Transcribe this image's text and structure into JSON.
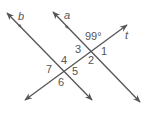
{
  "diagram": {
    "lines": [
      {
        "name": "b",
        "label": "b",
        "from": [
          7,
          13
        ],
        "to": [
          92,
          100
        ]
      },
      {
        "name": "a",
        "label": "a",
        "from": [
          53,
          12
        ],
        "to": [
          140,
          102
        ]
      },
      {
        "name": "t",
        "label": "t",
        "from": [
          25,
          100
        ],
        "to": [
          127,
          25
        ]
      }
    ],
    "given_angle": {
      "label": "99°",
      "value": 99
    },
    "angle_labels": [
      "1",
      "2",
      "3",
      "4",
      "5",
      "6",
      "7"
    ],
    "line_labels": {
      "a": "a",
      "b": "b",
      "t": "t"
    },
    "colors": {
      "stroke": "#555555",
      "text": "#555555",
      "background": "#ffffff"
    }
  }
}
